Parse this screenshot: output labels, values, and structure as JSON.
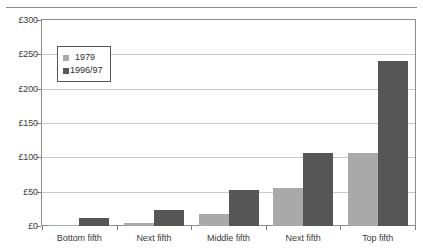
{
  "chart_data": {
    "type": "bar",
    "title": "",
    "xlabel": "",
    "ylabel": "",
    "categories": [
      "Bottom fifth",
      "Next fifth",
      "Middle fifth",
      "Next fifth",
      "Top fifth"
    ],
    "series": [
      {
        "name": "1979",
        "color": "#a9a9a9",
        "values": [
          2,
          5,
          18,
          56,
          106
        ]
      },
      {
        "name": "1996/97",
        "color": "#565656",
        "values": [
          12,
          24,
          53,
          106,
          241
        ]
      }
    ],
    "ylim": [
      0,
      300
    ],
    "ytick_values": [
      0,
      50,
      100,
      150,
      200,
      250,
      300
    ],
    "ytick_labels": [
      "£0",
      "£50",
      "£100",
      "£150",
      "£200",
      "£250",
      "£300"
    ],
    "currency_symbol": "£",
    "grid": true,
    "legend_position": "upper-left"
  },
  "legend": {
    "items": [
      {
        "label": "1979"
      },
      {
        "label": "1996/97"
      }
    ]
  },
  "page": {
    "ghost_caption": ""
  }
}
